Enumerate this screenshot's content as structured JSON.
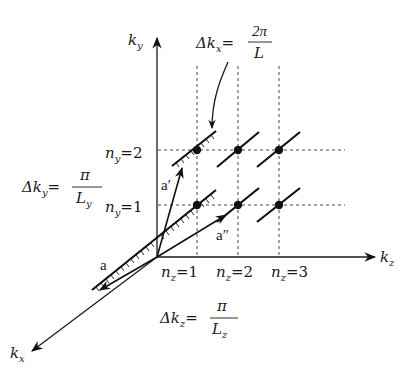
{
  "figure": {
    "axes": {
      "ky_label": "k",
      "ky_sub": "y",
      "kz_label": "k",
      "kz_sub": "z",
      "kx_label": "k",
      "kx_sub": "x"
    },
    "annotations": {
      "delta_kx": {
        "lhs": "Δk",
        "sub": "x",
        "num": "2π",
        "den": "L"
      },
      "delta_ky": {
        "lhs": "Δk",
        "sub": "y",
        "num": "π",
        "den": "L",
        "den_sub": "y"
      },
      "delta_kz": {
        "lhs": "Δk",
        "sub": "z",
        "num": "π",
        "den": "L",
        "den_sub": "z"
      }
    },
    "ny_labels": [
      {
        "n": "n",
        "sub": "y",
        "value": "=2"
      },
      {
        "n": "n",
        "sub": "y",
        "value": "=1"
      }
    ],
    "nz_labels": [
      {
        "n": "n",
        "sub": "z",
        "value": "=1"
      },
      {
        "n": "n",
        "sub": "z",
        "value": "=2"
      },
      {
        "n": "n",
        "sub": "z",
        "value": "=3"
      }
    ],
    "vectors": {
      "a": "a",
      "a_prime": "a′",
      "a_double_prime": "a″"
    },
    "colors": {
      "ink": "#1a1a1a",
      "background": "#ffffff"
    }
  }
}
